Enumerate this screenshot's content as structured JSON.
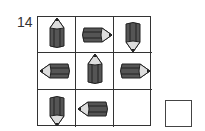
{
  "question_number": "14",
  "grid": {
    "cells": [
      {
        "icon": "pencil-icon",
        "direction": "up"
      },
      {
        "icon": "pencil-icon",
        "direction": "right"
      },
      {
        "icon": "pencil-icon",
        "direction": "down"
      },
      {
        "icon": "pencil-icon",
        "direction": "left"
      },
      {
        "icon": "pencil-icon",
        "direction": "up"
      },
      {
        "icon": "pencil-icon",
        "direction": "right"
      },
      {
        "icon": "pencil-icon",
        "direction": "down"
      },
      {
        "icon": "pencil-icon",
        "direction": "left"
      },
      {
        "icon": "empty",
        "direction": ""
      }
    ]
  },
  "answer_box": ""
}
